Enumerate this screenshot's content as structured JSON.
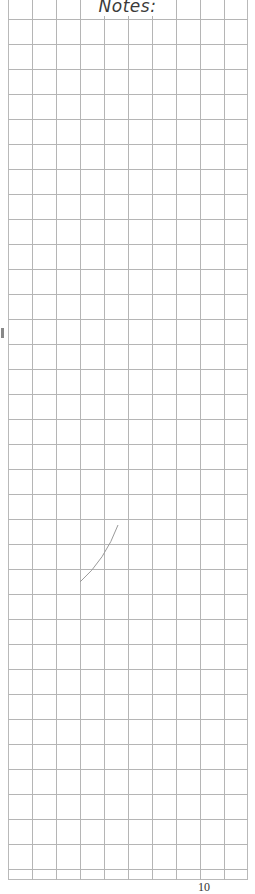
{
  "page": {
    "title": "Notes:",
    "page_number": "10",
    "grid": {
      "columns": 10,
      "rows": 35,
      "line_color": "#b5b5b5",
      "background": "#ffffff"
    }
  }
}
